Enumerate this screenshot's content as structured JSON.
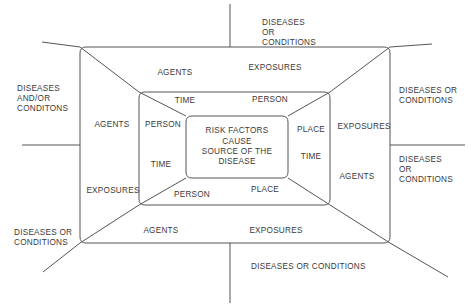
{
  "diagram": {
    "title_text": "Epidemiologic triangle nested frame diagram",
    "line_color": "#555555",
    "text_color": "#3a3a3a",
    "background": "#ffffff",
    "center": {
      "lines": [
        "RISK FACTORS",
        "CAUSE",
        "SOURCE OF THE",
        "DISEASE"
      ]
    },
    "inner_ring": {
      "top": "PERSON",
      "right": "PLACE",
      "bottom": "PLACE",
      "left": "TIME",
      "top_left": "TIME",
      "right_lower": "TIME",
      "bottom_left": "PERSON",
      "left_label": "PERSON"
    },
    "labels": {
      "agents_top_outer": "AGENTS",
      "exposures_top_outer": "EXPOSURES",
      "time_top_inner": "TIME",
      "person_top_inner": "PERSON",
      "agents_left_mid": "AGENTS",
      "person_left_mid": "PERSON",
      "place_right_mid": "PLACE",
      "exposures_right_mid": "EXPOSURES",
      "time_left_lower": "TIME",
      "time_right_lower": "TIME",
      "exposures_left_lower": "EXPOSURES",
      "person_bottom_inner": "PERSON",
      "place_bottom_inner": "PLACE",
      "agents_right_lower": "AGENTS",
      "agents_bottom_outer": "AGENTS",
      "exposures_bottom_outer": "EXPOSURES"
    },
    "outside": {
      "top": "DISEASES\nOR\nCONDITIONS",
      "left_upper": "DISEASES\nAND/OR\nCONDITONS",
      "right_upper": "DISEASES OR\nCONDITIONS",
      "right_lower": "DISEASES\nOR\nCONDITIONS",
      "left_lower": "DISEASES OR\nCONDITIONS",
      "bottom": "DISEASES OR CONDITIONS"
    }
  }
}
